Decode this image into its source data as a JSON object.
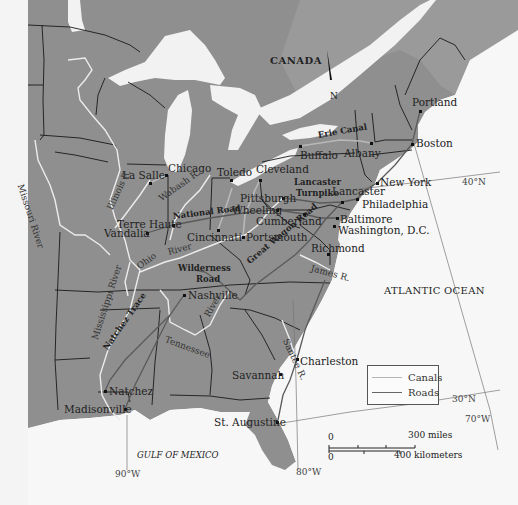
{
  "map": {
    "title_region": "CANADA",
    "north_arrow": "N",
    "ocean_labels": {
      "atlantic": "ATLANTIC OCEAN",
      "gulf": "GULF OF MEXICO"
    },
    "cities": [
      {
        "name": "Portland",
        "x": 420,
        "y": 111,
        "lx": 412,
        "ly": 97
      },
      {
        "name": "Boston",
        "x": 412,
        "y": 144,
        "lx": 416,
        "ly": 138
      },
      {
        "name": "Albany",
        "x": 371,
        "y": 143,
        "lx": 344,
        "ly": 148
      },
      {
        "name": "Buffalo",
        "x": 300,
        "y": 146,
        "lx": 300,
        "ly": 150
      },
      {
        "name": "New York",
        "x": 377,
        "y": 183,
        "lx": 380,
        "ly": 177
      },
      {
        "name": "Cleveland",
        "x": 260,
        "y": 180,
        "lx": 256,
        "ly": 164
      },
      {
        "name": "Toledo",
        "x": 231,
        "y": 180,
        "lx": 217,
        "ly": 167
      },
      {
        "name": "Chicago",
        "x": 166,
        "y": 175,
        "lx": 168,
        "ly": 163
      },
      {
        "name": "La Salle",
        "x": 150,
        "y": 183,
        "lx": 122,
        "ly": 170
      },
      {
        "name": "Pittsburgh",
        "x": 283,
        "y": 198,
        "lx": 240,
        "ly": 193
      },
      {
        "name": "Wheeling",
        "x": 277,
        "y": 210,
        "lx": 232,
        "ly": 205
      },
      {
        "name": "Lancaster",
        "x": 342,
        "y": 202,
        "lx": 332,
        "ly": 186
      },
      {
        "name": "Philadelphia",
        "x": 357,
        "y": 199,
        "lx": 362,
        "ly": 199
      },
      {
        "name": "Cumberland",
        "x": 304,
        "y": 214,
        "lx": 256,
        "ly": 216
      },
      {
        "name": "Baltimore",
        "x": 337,
        "y": 218,
        "lx": 340,
        "ly": 214
      },
      {
        "name": "Washington, D.C.",
        "x": 334,
        "y": 226,
        "lx": 338,
        "ly": 225
      },
      {
        "name": "Terre Haute",
        "x": 173,
        "y": 225,
        "lx": 117,
        "ly": 219
      },
      {
        "name": "Vandalia",
        "x": 147,
        "y": 233,
        "lx": 104,
        "ly": 228
      },
      {
        "name": "Cincinnati",
        "x": 218,
        "y": 230,
        "lx": 187,
        "ly": 232
      },
      {
        "name": "Portsmouth",
        "x": 243,
        "y": 237,
        "lx": 246,
        "ly": 232
      },
      {
        "name": "Richmond",
        "x": 328,
        "y": 254,
        "lx": 311,
        "ly": 243
      },
      {
        "name": "Nashville",
        "x": 184,
        "y": 295,
        "lx": 188,
        "ly": 290
      },
      {
        "name": "Charleston",
        "x": 297,
        "y": 359,
        "lx": 300,
        "ly": 356
      },
      {
        "name": "Savannah",
        "x": 280,
        "y": 374,
        "lx": 232,
        "ly": 370
      },
      {
        "name": "Natchez",
        "x": 105,
        "y": 391,
        "lx": 109,
        "ly": 386
      },
      {
        "name": "Madisonville",
        "x": 125,
        "y": 409,
        "lx": 64,
        "ly": 404
      },
      {
        "name": "St. Augustine",
        "x": 277,
        "y": 422,
        "lx": 214,
        "ly": 417
      }
    ],
    "route_labels": [
      {
        "name": "Erie Canal",
        "x": 318,
        "y": 131,
        "rot": -10,
        "cls": "bold"
      },
      {
        "name": "Lancaster",
        "x": 294,
        "y": 178,
        "rot": 0,
        "cls": "bold"
      },
      {
        "name": "Turnpike",
        "x": 296,
        "y": 189,
        "rot": 0,
        "cls": "bold"
      },
      {
        "name": "National Road",
        "x": 173,
        "y": 212,
        "rot": -7,
        "cls": "bold"
      },
      {
        "name": "Wilderness",
        "x": 178,
        "y": 264,
        "rot": 0,
        "cls": "bold"
      },
      {
        "name": "Road",
        "x": 196,
        "y": 275,
        "rot": 0,
        "cls": "bold"
      },
      {
        "name": "Great Wagon Road",
        "x": 248,
        "y": 258,
        "rot": -40,
        "cls": "bold"
      },
      {
        "name": "Natchez Trace",
        "x": 105,
        "y": 345,
        "rot": -55,
        "cls": "bold"
      }
    ],
    "river_labels": [
      {
        "name": "Missouri River",
        "x": 20,
        "y": 180,
        "rot": 72
      },
      {
        "name": "Illinois R.",
        "x": 110,
        "y": 205,
        "rot": -65
      },
      {
        "name": "Wabash R.",
        "x": 160,
        "y": 195,
        "rot": -35
      },
      {
        "name": "Ohio",
        "x": 138,
        "y": 263,
        "rot": -35
      },
      {
        "name": "River",
        "x": 168,
        "y": 248,
        "rot": -15
      },
      {
        "name": "Mississippi River",
        "x": 95,
        "y": 335,
        "rot": -72
      },
      {
        "name": "Tennessee",
        "x": 165,
        "y": 335,
        "rot": 20
      },
      {
        "name": "River",
        "x": 207,
        "y": 312,
        "rot": -60
      },
      {
        "name": "Santee R.",
        "x": 285,
        "y": 335,
        "rot": 65
      },
      {
        "name": "James R.",
        "x": 311,
        "y": 264,
        "rot": 15
      }
    ],
    "grid_labels": [
      {
        "text": "40°N",
        "x": 462,
        "y": 178
      },
      {
        "text": "30°N",
        "x": 452,
        "y": 395
      },
      {
        "text": "70°W",
        "x": 465,
        "y": 415
      },
      {
        "text": "80°W",
        "x": 296,
        "y": 468
      },
      {
        "text": "90°W",
        "x": 115,
        "y": 470
      }
    ],
    "legend": {
      "items": [
        {
          "label": "Canals",
          "color": "#aaaaaa"
        },
        {
          "label": "Roads",
          "color": "#666666"
        }
      ]
    },
    "scale": {
      "miles_zero": "0",
      "miles_label": "300 miles",
      "km_zero": "0",
      "km_label": "400 kilometers"
    },
    "colors": {
      "land": "#8f8f8f",
      "water": "#f7f7f7",
      "canada": "#999999",
      "border": "#1a1a1a",
      "river": "#eeeeee",
      "road": "#5a5a5a",
      "canal": "#b5b5b5"
    }
  }
}
